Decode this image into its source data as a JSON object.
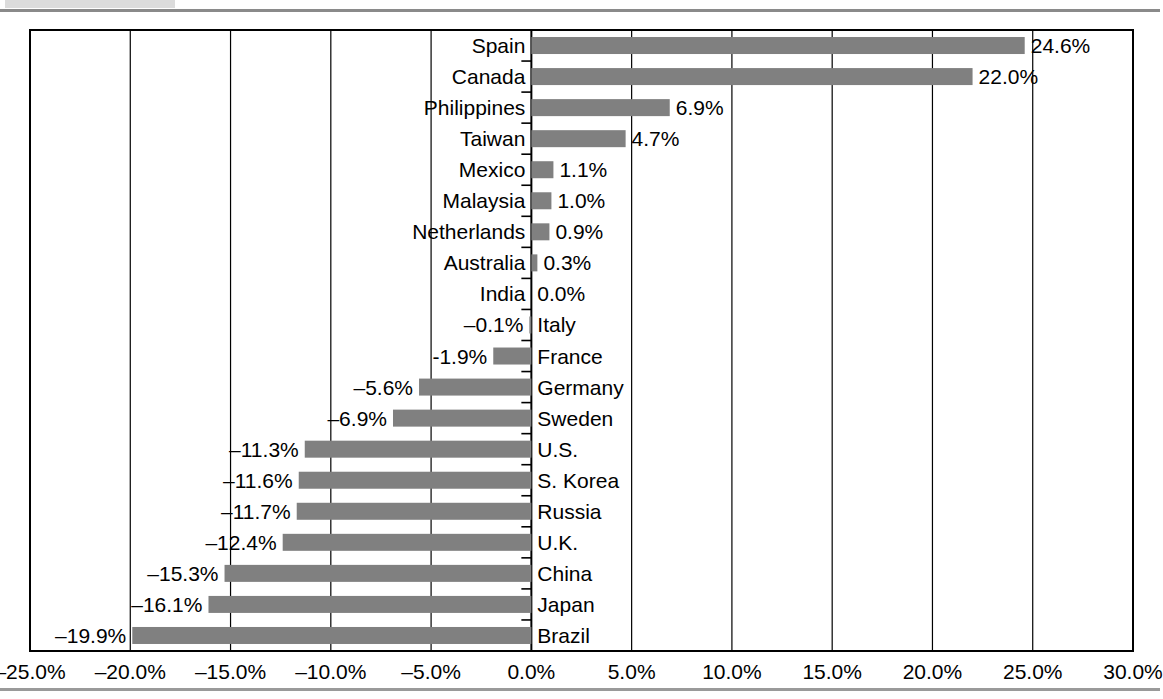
{
  "chart_data": {
    "type": "bar",
    "orientation": "horizontal",
    "title": "",
    "subtitle": "",
    "xlabel": "",
    "ylabel": "",
    "xlim": [
      -25.0,
      30.0
    ],
    "xtick_step": 5.0,
    "xtick_labels": [
      "–25.0%",
      "–20.0%",
      "–15.0%",
      "–10.0%",
      "–5.0%",
      "0.0%",
      "5.0%",
      "10.0%",
      "15.0%",
      "20.0%",
      "25.0%",
      "30.0%"
    ],
    "xtick_values": [
      -25,
      -20,
      -15,
      -10,
      -5,
      0,
      5,
      10,
      15,
      20,
      25,
      30
    ],
    "grid": true,
    "grid_axis": "x",
    "legend": false,
    "bar_color": "#808080",
    "axis_color": "#000000",
    "categories": [
      "Spain",
      "Canada",
      "Philippines",
      "Taiwan",
      "Mexico",
      "Malaysia",
      "Netherlands",
      "Australia",
      "India",
      "Italy",
      "France",
      "Germany",
      "Sweden",
      "U.S.",
      "S. Korea",
      "Russia",
      "U.K.",
      "China",
      "Japan",
      "Brazil"
    ],
    "values": [
      24.6,
      22.0,
      6.9,
      4.7,
      1.1,
      1.0,
      0.9,
      0.3,
      0.0,
      -0.1,
      -1.9,
      -5.6,
      -6.9,
      -11.3,
      -11.6,
      -11.7,
      -12.4,
      -15.3,
      -16.1,
      -19.9
    ],
    "value_labels": [
      "24.6%",
      "22.0%",
      "6.9%",
      "4.7%",
      "1.1%",
      "1.0%",
      "0.9%",
      "0.3%",
      "0.0%",
      "–0.1%",
      "-1.9%",
      "–5.6%",
      "–6.9%",
      "–11.3%",
      "–11.6%",
      "–11.7%",
      "–12.4%",
      "–15.3%",
      "–16.1%",
      "–19.9%"
    ],
    "points": [
      {
        "category": "Spain",
        "value": 24.6,
        "label": "24.6%"
      },
      {
        "category": "Canada",
        "value": 22.0,
        "label": "22.0%"
      },
      {
        "category": "Philippines",
        "value": 6.9,
        "label": "6.9%"
      },
      {
        "category": "Taiwan",
        "value": 4.7,
        "label": "4.7%"
      },
      {
        "category": "Mexico",
        "value": 1.1,
        "label": "1.1%"
      },
      {
        "category": "Malaysia",
        "value": 1.0,
        "label": "1.0%"
      },
      {
        "category": "Netherlands",
        "value": 0.9,
        "label": "0.9%"
      },
      {
        "category": "Australia",
        "value": 0.3,
        "label": "0.3%"
      },
      {
        "category": "India",
        "value": 0.0,
        "label": "0.0%"
      },
      {
        "category": "Italy",
        "value": -0.1,
        "label": "–0.1%"
      },
      {
        "category": "France",
        "value": -1.9,
        "label": "-1.9%"
      },
      {
        "category": "Germany",
        "value": -5.6,
        "label": "–5.6%"
      },
      {
        "category": "Sweden",
        "value": -6.9,
        "label": "–6.9%"
      },
      {
        "category": "U.S.",
        "value": -11.3,
        "label": "–11.3%"
      },
      {
        "category": "S. Korea",
        "value": -11.6,
        "label": "–11.6%"
      },
      {
        "category": "Russia",
        "value": -11.7,
        "label": "–11.7%"
      },
      {
        "category": "U.K.",
        "value": -12.4,
        "label": "–12.4%"
      },
      {
        "category": "China",
        "value": -15.3,
        "label": "–15.3%"
      },
      {
        "category": "Japan",
        "value": -16.1,
        "label": "–16.1%"
      },
      {
        "category": "Brazil",
        "value": -19.9,
        "label": "–19.9%"
      }
    ]
  }
}
